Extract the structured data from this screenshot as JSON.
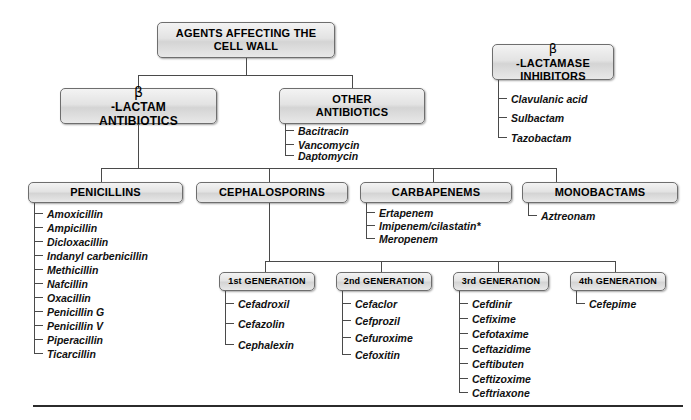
{
  "diagram": {
    "title": "Agents Affecting the Cell Wall",
    "type": "hierarchy-tree",
    "footnote_marker": "*"
  },
  "boxes": {
    "root": {
      "line1": "AGENTS AFFECTING THE",
      "line2": "CELL WALL"
    },
    "beta_lactam": {
      "beta": "β",
      "line1": "-LACTAM",
      "line2": "ANTIBIOTICS"
    },
    "other_antibiotics": {
      "line1": "OTHER",
      "line2": "ANTIBIOTICS"
    },
    "beta_lactamase": {
      "beta": "β",
      "line1": "-LACTAMASE",
      "line2": "INHIBITORS"
    },
    "penicillins": {
      "label": "PENICILLINS"
    },
    "cephalosporins": {
      "label": "CEPHALOSPORINS"
    },
    "carbapenems": {
      "label": "CARBAPENEMS"
    },
    "monobactams": {
      "label": "MONOBACTAMS"
    },
    "gen1": {
      "label": "1st GENERATION"
    },
    "gen2": {
      "label": "2nd GENERATION"
    },
    "gen3": {
      "label": "3rd GENERATION"
    },
    "gen4": {
      "label": "4th GENERATION"
    }
  },
  "lists": {
    "other_antibiotics": [
      "Bacitracin",
      "Vancomycin",
      "Daptomycin"
    ],
    "beta_lactamase_inhibitors": [
      "Clavulanic acid",
      "Sulbactam",
      "Tazobactam"
    ],
    "penicillins": [
      "Amoxicillin",
      "Ampicillin",
      "Dicloxacillin",
      "Indanyl carbenicillin",
      "Methicillin",
      "Nafcillin",
      "Oxacillin",
      "Penicillin G",
      "Penicillin V",
      "Piperacillin",
      "Ticarcillin"
    ],
    "carbapenems": [
      "Ertapenem",
      "Imipenem/cilastatin*",
      "Meropenem"
    ],
    "monobactams": [
      "Aztreonam"
    ],
    "gen1": [
      "Cefadroxil",
      "Cefazolin",
      "Cephalexin"
    ],
    "gen2": [
      "Cefaclor",
      "Cefprozil",
      "Cefuroxime",
      "Cefoxitin"
    ],
    "gen3": [
      "Cefdinir",
      "Cefixime",
      "Cefotaxime",
      "Ceftazidime",
      "Ceftibuten",
      "Ceftizoxime",
      "Ceftriaxone"
    ],
    "gen4": [
      "Cefepime"
    ]
  },
  "colors": {
    "box_border": "#6e6e6e",
    "box_fill": "#e3e3e3",
    "connector": "#4a4a4a",
    "text": "#000000",
    "footer_rule": "#2b2b2b"
  }
}
